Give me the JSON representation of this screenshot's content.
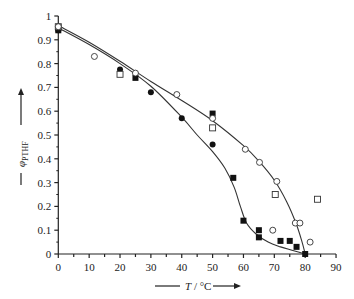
{
  "chart_data": {
    "type": "scatter",
    "title": "",
    "xlabel": "T / °C",
    "ylabel": "φ_PTHF",
    "xlim": [
      0,
      90
    ],
    "ylim": [
      0,
      1
    ],
    "x_ticks": [
      0,
      10,
      20,
      30,
      40,
      50,
      60,
      70,
      80,
      90
    ],
    "x_tick_labels": [
      "0",
      "10",
      "20",
      "30",
      "40",
      "50",
      "60",
      "70",
      "80",
      "90"
    ],
    "y_ticks": [
      0,
      0.1,
      0.2,
      0.3,
      0.4,
      0.5,
      0.6,
      0.7,
      0.8,
      0.9,
      1
    ],
    "y_tick_labels": [
      "0",
      "0.1",
      "0.2",
      "0.3",
      "0.4",
      "0.5",
      "0.6",
      "0.7",
      "0.8",
      "0.9",
      "1"
    ],
    "grid": false,
    "legend": null,
    "series": [
      {
        "name": "filled squares",
        "marker": "square-filled",
        "points": [
          [
            0,
            0.94
          ],
          [
            25,
            0.74
          ],
          [
            50,
            0.59
          ],
          [
            56.7,
            0.32
          ],
          [
            60,
            0.14
          ],
          [
            65,
            0.1
          ],
          [
            65,
            0.07
          ],
          [
            72,
            0.055
          ],
          [
            75,
            0.055
          ],
          [
            77.2,
            0.03
          ],
          [
            80,
            0.0
          ]
        ]
      },
      {
        "name": "filled circles",
        "marker": "circle-filled",
        "points": [
          [
            0,
            0.94
          ],
          [
            20,
            0.775
          ],
          [
            30,
            0.68
          ],
          [
            40,
            0.57
          ],
          [
            50,
            0.46
          ]
        ]
      },
      {
        "name": "open squares",
        "marker": "square-open",
        "points": [
          [
            0,
            0.955
          ],
          [
            20,
            0.755
          ],
          [
            50,
            0.53
          ],
          [
            70.3,
            0.25
          ],
          [
            84,
            0.23
          ]
        ]
      },
      {
        "name": "open circles",
        "marker": "circle-open",
        "points": [
          [
            0,
            0.955
          ],
          [
            11.7,
            0.83
          ],
          [
            25,
            0.76
          ],
          [
            38.4,
            0.67
          ],
          [
            50,
            0.57
          ],
          [
            60.6,
            0.44
          ],
          [
            65.2,
            0.385
          ],
          [
            70.8,
            0.305
          ],
          [
            69.5,
            0.1
          ],
          [
            76.8,
            0.13
          ],
          [
            78.3,
            0.13
          ],
          [
            81.6,
            0.05
          ]
        ]
      }
    ],
    "curves": [
      {
        "name": "upper fit curve",
        "points": [
          [
            0,
            0.96
          ],
          [
            10,
            0.89
          ],
          [
            20,
            0.81
          ],
          [
            30,
            0.725
          ],
          [
            40,
            0.645
          ],
          [
            50,
            0.56
          ],
          [
            60,
            0.455
          ],
          [
            65,
            0.39
          ],
          [
            70,
            0.31
          ],
          [
            74,
            0.22
          ],
          [
            77,
            0.13
          ],
          [
            79,
            0.05
          ],
          [
            80,
            0.0
          ]
        ]
      },
      {
        "name": "lower fit curve",
        "points": [
          [
            0,
            0.95
          ],
          [
            10,
            0.88
          ],
          [
            20,
            0.8
          ],
          [
            30,
            0.705
          ],
          [
            40,
            0.575
          ],
          [
            45,
            0.5
          ],
          [
            50,
            0.43
          ],
          [
            54,
            0.36
          ],
          [
            57,
            0.28
          ],
          [
            59,
            0.2
          ],
          [
            61,
            0.13
          ],
          [
            64,
            0.085
          ],
          [
            68,
            0.05
          ],
          [
            72,
            0.03
          ],
          [
            76,
            0.015
          ],
          [
            80,
            0.0
          ]
        ]
      }
    ]
  }
}
